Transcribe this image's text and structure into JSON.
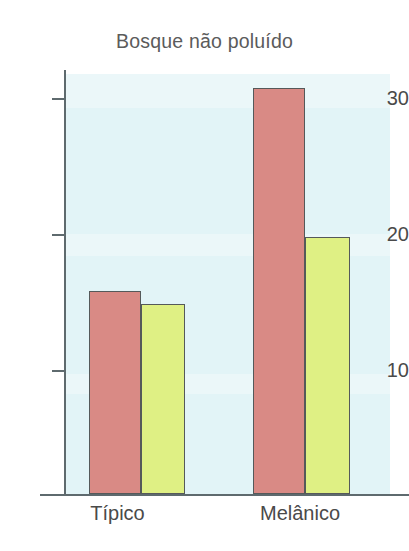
{
  "chart_data": {
    "type": "bar",
    "title": "Bosque não poluído",
    "xlabel": "",
    "ylabel": "",
    "categories": [
      "Típico",
      "Melânico"
    ],
    "series": [
      {
        "name": "serie-1",
        "color": "#d98a85",
        "values": [
          16,
          31
        ]
      },
      {
        "name": "serie-2",
        "color": "#dff084",
        "values": [
          15,
          20
        ]
      }
    ],
    "yticks": [
      10,
      20,
      30
    ],
    "ytick_labels": [
      "10",
      "20",
      "30"
    ],
    "ylim": [
      1,
      32
    ],
    "grid": false,
    "legend": "none",
    "plot_background": "#e2f4f7",
    "axis_color": "#5e6a6e",
    "bar_edge_color": "#55595a",
    "title_color": "#5b5b5b",
    "label_color": "#4a4a4a"
  },
  "axis": {
    "tick_10": "10",
    "tick_20": "20",
    "tick_30": "30"
  },
  "categories": {
    "typico": "Típico",
    "melanico": "Melânico"
  }
}
